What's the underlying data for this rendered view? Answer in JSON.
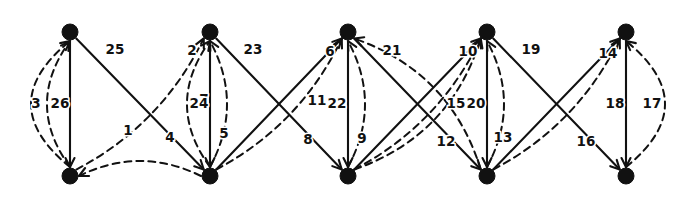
{
  "diagram": {
    "type": "graph",
    "canvas": {
      "width": 690,
      "height": 209
    },
    "style": {
      "background_color": "#ffffff",
      "edge_color": "#111111",
      "node_color": "#111111",
      "label_color": "#111111",
      "solid_edge_style": "solid",
      "curved_edge_style": "dashed"
    },
    "nodes": [
      {
        "id": "t1",
        "label": "",
        "x": 70,
        "y": 32,
        "row": "top",
        "radius": 8
      },
      {
        "id": "t2",
        "label": "",
        "x": 210,
        "y": 32,
        "row": "top",
        "radius": 8
      },
      {
        "id": "t3",
        "label": "",
        "x": 348,
        "y": 32,
        "row": "top",
        "radius": 8
      },
      {
        "id": "t4",
        "label": "",
        "x": 487,
        "y": 32,
        "row": "top",
        "radius": 8
      },
      {
        "id": "t5",
        "label": "",
        "x": 626,
        "y": 32,
        "row": "top",
        "radius": 8
      },
      {
        "id": "b1",
        "label": "",
        "x": 70,
        "y": 176,
        "row": "bottom",
        "radius": 8
      },
      {
        "id": "b2",
        "label": "",
        "x": 210,
        "y": 176,
        "row": "bottom",
        "radius": 8
      },
      {
        "id": "b3",
        "label": "",
        "x": 348,
        "y": 176,
        "row": "bottom",
        "radius": 8
      },
      {
        "id": "b4",
        "label": "",
        "x": 487,
        "y": 176,
        "row": "bottom",
        "radius": 8
      },
      {
        "id": "b5",
        "label": "",
        "x": 626,
        "y": 176,
        "row": "bottom",
        "radius": 8
      }
    ],
    "edges": [
      {
        "label": "1",
        "from": "b2",
        "to": "b1",
        "style": "dashed",
        "curve": "arc",
        "label_x": 128,
        "label_y": 131
      },
      {
        "label": "2",
        "from": "b1",
        "to": "t2",
        "style": "dashed",
        "curve": "arc",
        "label_x": 192,
        "label_y": 51
      },
      {
        "label": "3",
        "from": "b1",
        "to": "t1",
        "style": "dashed",
        "curve": "arc-left",
        "label_x": 36,
        "label_y": 104
      },
      {
        "label": "4",
        "from": "t1",
        "to": "b2",
        "style": "solid",
        "curve": "straight",
        "label_x": 170,
        "label_y": 138
      },
      {
        "label": "5",
        "from": "b2",
        "to": "t3",
        "style": "dashed",
        "curve": "arc",
        "label_x": 224,
        "label_y": 134
      },
      {
        "label": "6",
        "from": "b2",
        "to": "t3",
        "style": "solid",
        "curve": "straight",
        "label_x": 330,
        "label_y": 52
      },
      {
        "label": "7",
        "from": "b2",
        "to": "t2",
        "style": "dashed",
        "curve": "arc",
        "label_x": 204,
        "label_y": 100
      },
      {
        "label": "8",
        "from": "t2",
        "to": "b3",
        "style": "solid",
        "curve": "straight",
        "label_x": 308,
        "label_y": 140
      },
      {
        "label": "9",
        "from": "b3",
        "to": "t4",
        "style": "dashed",
        "curve": "arc",
        "label_x": 362,
        "label_y": 139
      },
      {
        "label": "10",
        "from": "b3",
        "to": "t4",
        "style": "solid",
        "curve": "straight",
        "label_x": 468,
        "label_y": 52
      },
      {
        "label": "11",
        "from": "b3",
        "to": "t3",
        "style": "dashed",
        "curve": "arc",
        "label_x": 317,
        "label_y": 101
      },
      {
        "label": "12",
        "from": "t3",
        "to": "b4",
        "style": "solid",
        "curve": "straight",
        "label_x": 446,
        "label_y": 142
      },
      {
        "label": "13",
        "from": "b4",
        "to": "t5",
        "style": "dashed",
        "curve": "arc",
        "label_x": 503,
        "label_y": 138
      },
      {
        "label": "14",
        "from": "b4",
        "to": "t5",
        "style": "solid",
        "curve": "straight",
        "label_x": 608,
        "label_y": 54
      },
      {
        "label": "15",
        "from": "b4",
        "to": "t4",
        "style": "dashed",
        "curve": "arc",
        "label_x": 456,
        "label_y": 104
      },
      {
        "label": "16",
        "from": "t4",
        "to": "b5",
        "style": "solid",
        "curve": "straight",
        "label_x": 586,
        "label_y": 142
      },
      {
        "label": "17",
        "from": "b5",
        "to": "t5",
        "style": "dashed",
        "curve": "arc-right",
        "label_x": 652,
        "label_y": 104
      },
      {
        "label": "18",
        "from": "t5",
        "to": "b5",
        "style": "solid",
        "curve": "straight",
        "label_x": 615,
        "label_y": 104
      },
      {
        "label": "19",
        "from": "b3",
        "to": "t4",
        "style": "dashed",
        "curve": "arc-top",
        "label_x": 531,
        "label_y": 50
      },
      {
        "label": "20",
        "from": "t4",
        "to": "b4",
        "style": "solid",
        "curve": "straight",
        "label_x": 476,
        "label_y": 104
      },
      {
        "label": "21",
        "from": "b4",
        "to": "t3",
        "style": "dashed",
        "curve": "arc-top",
        "label_x": 392,
        "label_y": 51
      },
      {
        "label": "22",
        "from": "t3",
        "to": "b3",
        "style": "solid",
        "curve": "straight",
        "label_x": 337,
        "label_y": 104
      },
      {
        "label": "23",
        "from": "b2",
        "to": "t2",
        "style": "dashed",
        "curve": "arc-top",
        "label_x": 253,
        "label_y": 50
      },
      {
        "label": "24",
        "from": "t2",
        "to": "b2",
        "style": "solid",
        "curve": "straight",
        "label_x": 199,
        "label_y": 104
      },
      {
        "label": "25",
        "from": "b1",
        "to": "t1",
        "style": "dashed",
        "curve": "arc-top",
        "label_x": 115,
        "label_y": 50
      },
      {
        "label": "26",
        "from": "t1",
        "to": "b1",
        "style": "solid",
        "curve": "straight",
        "label_x": 60,
        "label_y": 104
      }
    ]
  }
}
